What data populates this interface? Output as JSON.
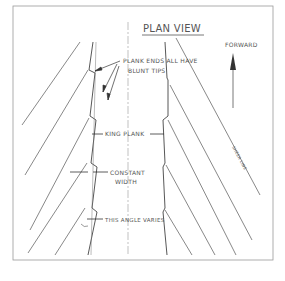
{
  "title": "PLAN VIEW",
  "labels": {
    "forward": "FORWARD",
    "plank_ends_line1": "PLANK ENDS ALL HAVE",
    "plank_ends_line2": "BLUNT TIPS",
    "king_plank": "KING PLANK",
    "constant_line1": "CONSTANT",
    "constant_line2": "WIDTH",
    "angle_varies": "THIS ANGLE VARIES",
    "side_note": "SHEER LINE"
  },
  "colors": {
    "ink": "#444444",
    "frame": "#888888",
    "background": "#ffffff"
  }
}
